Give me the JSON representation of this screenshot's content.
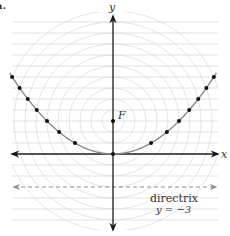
{
  "figure": {
    "part_label": "a.",
    "x_axis_label": "x",
    "y_axis_label": "y",
    "focus_label": "F",
    "directrix_label": "directrix",
    "directrix_equation": "y = −3",
    "colors": {
      "axis": "#1a1a1a",
      "grid": "#d9d9d9",
      "circles": "#dcdcdc",
      "parabola": "#8a8a8a",
      "dots": "#111111",
      "directrix": "#8f8f8f",
      "text": "#333333"
    }
  },
  "chart_data": {
    "type": "line",
    "title": "",
    "xlabel": "x",
    "ylabel": "y",
    "xlim": [
      -9.4,
      9.4
    ],
    "ylim": [
      -6.7,
      12.7
    ],
    "grid": "horizontal lines every 1 unit; concentric circles about focus with radii 1..10",
    "focus": {
      "label": "F",
      "x": 0,
      "y": 3
    },
    "directrix": {
      "label": "directrix",
      "equation": "y = -3",
      "y": -3,
      "style": "dashed"
    },
    "series": [
      {
        "name": "parabola",
        "equation": "x^2 = 12y",
        "points": [
          [
            -9.17,
            7
          ],
          [
            -8.49,
            6
          ],
          [
            -7.75,
            5
          ],
          [
            -6.93,
            4
          ],
          [
            -6.0,
            3
          ],
          [
            -4.9,
            2
          ],
          [
            -3.46,
            1
          ],
          [
            0,
            0
          ],
          [
            3.46,
            1
          ],
          [
            4.9,
            2
          ],
          [
            6.0,
            3
          ],
          [
            6.93,
            4
          ],
          [
            7.75,
            5
          ],
          [
            8.49,
            6
          ],
          [
            9.17,
            7
          ]
        ]
      }
    ]
  }
}
